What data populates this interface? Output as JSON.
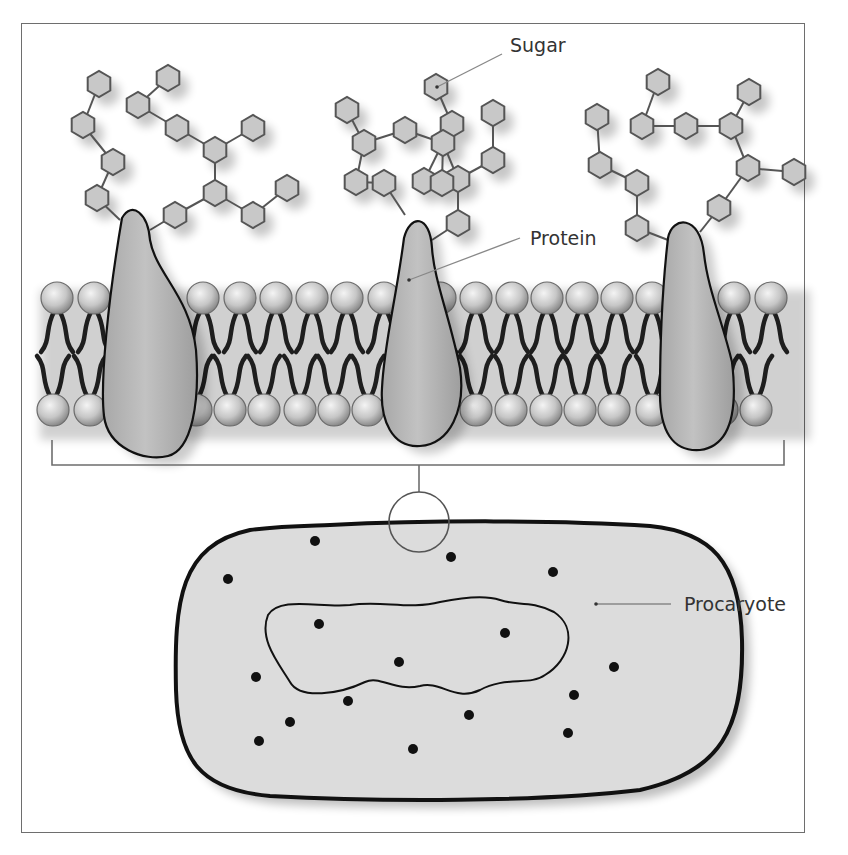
{
  "figure": {
    "labels": {
      "sugar": "Sugar",
      "protein": "Protein",
      "procaryote": "Procaryote"
    },
    "colors": {
      "frame": "#6e6e6e",
      "hexagon_fill": "#c8c8c8",
      "hexagon_stroke": "#555555",
      "protein_fill": "#b4b4b4",
      "head_fill": "#cfcfcf",
      "tail": "#1e1e1e",
      "cell_fill": "#dcdcdc",
      "cell_stroke": "#111111",
      "dot": "#111111",
      "leader": "#888888"
    },
    "membrane": {
      "top_row_y": 298,
      "bottom_row_y": 410,
      "head_radius": 16,
      "top_heads_x": [
        57,
        94,
        131,
        203,
        240,
        276,
        312,
        347,
        384,
        440,
        476,
        512,
        547,
        582,
        617,
        652,
        734,
        771
      ],
      "bottom_heads_x": [
        53,
        90,
        196,
        230,
        264,
        300,
        334,
        368,
        476,
        511,
        546,
        580,
        614,
        652,
        722,
        756
      ]
    },
    "proteins": [
      {
        "id": "protein-left",
        "path": "M122,218 C132,200 148,214 150,240 C156,274 190,296 196,350 C200,402 192,450 168,456 C144,462 108,448 104,416 C100,382 108,300 122,218 Z"
      },
      {
        "id": "protein-middle",
        "path": "M404,238 C410,214 430,214 432,248 C434,280 450,318 460,368 C466,410 450,444 420,446 C392,448 380,420 382,388 C384,344 396,300 404,238 Z"
      },
      {
        "id": "protein-right",
        "path": "M668,238 C672,216 700,214 704,254 C708,290 722,320 732,362 C738,412 730,446 700,450 C672,452 660,430 660,394 C660,340 662,290 668,238 Z"
      }
    ],
    "sugar_chains": {
      "hexagons": [
        [
          99,
          84
        ],
        [
          83,
          125
        ],
        [
          113,
          162
        ],
        [
          97,
          198
        ],
        [
          168,
          78
        ],
        [
          138,
          105
        ],
        [
          177,
          128
        ],
        [
          215,
          150
        ],
        [
          253,
          128
        ],
        [
          215,
          193
        ],
        [
          175,
          215
        ],
        [
          253,
          215
        ],
        [
          287,
          188
        ],
        [
          436,
          87
        ],
        [
          452,
          124
        ],
        [
          493,
          113
        ],
        [
          493,
          160
        ],
        [
          458,
          179
        ],
        [
          458,
          223
        ],
        [
          424,
          181
        ],
        [
          347,
          110
        ],
        [
          364,
          143
        ],
        [
          405,
          130
        ],
        [
          443,
          143
        ],
        [
          442,
          183
        ],
        [
          384,
          183
        ],
        [
          356,
          182
        ],
        [
          658,
          82
        ],
        [
          642,
          126
        ],
        [
          686,
          126
        ],
        [
          731,
          126
        ],
        [
          749,
          92
        ],
        [
          748,
          168
        ],
        [
          794,
          172
        ],
        [
          719,
          208
        ],
        [
          597,
          117
        ],
        [
          600,
          165
        ],
        [
          637,
          183
        ],
        [
          637,
          228
        ]
      ],
      "bonds": [
        [
          [
            99,
            84
          ],
          [
            83,
            125
          ]
        ],
        [
          [
            83,
            125
          ],
          [
            113,
            162
          ]
        ],
        [
          [
            113,
            162
          ],
          [
            97,
            198
          ]
        ],
        [
          [
            97,
            198
          ],
          [
            120,
            220
          ]
        ],
        [
          [
            168,
            78
          ],
          [
            138,
            105
          ]
        ],
        [
          [
            138,
            105
          ],
          [
            177,
            128
          ]
        ],
        [
          [
            177,
            128
          ],
          [
            215,
            150
          ]
        ],
        [
          [
            215,
            150
          ],
          [
            253,
            128
          ]
        ],
        [
          [
            215,
            150
          ],
          [
            215,
            193
          ]
        ],
        [
          [
            215,
            193
          ],
          [
            175,
            215
          ]
        ],
        [
          [
            215,
            193
          ],
          [
            253,
            215
          ]
        ],
        [
          [
            253,
            215
          ],
          [
            287,
            188
          ]
        ],
        [
          [
            175,
            215
          ],
          [
            150,
            230
          ]
        ],
        [
          [
            436,
            87
          ],
          [
            452,
            124
          ]
        ],
        [
          [
            452,
            124
          ],
          [
            424,
            181
          ]
        ],
        [
          [
            347,
            110
          ],
          [
            364,
            143
          ]
        ],
        [
          [
            364,
            143
          ],
          [
            405,
            130
          ]
        ],
        [
          [
            405,
            130
          ],
          [
            443,
            143
          ]
        ],
        [
          [
            443,
            143
          ],
          [
            442,
            183
          ]
        ],
        [
          [
            443,
            143
          ],
          [
            458,
            179
          ]
        ],
        [
          [
            493,
            113
          ],
          [
            493,
            160
          ]
        ],
        [
          [
            493,
            160
          ],
          [
            458,
            179
          ]
        ],
        [
          [
            458,
            179
          ],
          [
            458,
            223
          ]
        ],
        [
          [
            458,
            223
          ],
          [
            432,
            240
          ]
        ],
        [
          [
            364,
            143
          ],
          [
            356,
            182
          ]
        ],
        [
          [
            356,
            182
          ],
          [
            384,
            183
          ]
        ],
        [
          [
            384,
            183
          ],
          [
            405,
            215
          ]
        ],
        [
          [
            658,
            82
          ],
          [
            642,
            126
          ]
        ],
        [
          [
            642,
            126
          ],
          [
            686,
            126
          ]
        ],
        [
          [
            686,
            126
          ],
          [
            731,
            126
          ]
        ],
        [
          [
            731,
            126
          ],
          [
            749,
            92
          ]
        ],
        [
          [
            731,
            126
          ],
          [
            748,
            168
          ]
        ],
        [
          [
            748,
            168
          ],
          [
            794,
            172
          ]
        ],
        [
          [
            748,
            168
          ],
          [
            719,
            208
          ]
        ],
        [
          [
            719,
            208
          ],
          [
            700,
            232
          ]
        ],
        [
          [
            597,
            117
          ],
          [
            600,
            165
          ]
        ],
        [
          [
            600,
            165
          ],
          [
            637,
            183
          ]
        ],
        [
          [
            637,
            183
          ],
          [
            637,
            228
          ]
        ],
        [
          [
            637,
            228
          ],
          [
            668,
            240
          ]
        ]
      ]
    },
    "bracket": {
      "left_x": 52,
      "right_x": 784,
      "y": 465,
      "top_y": 440,
      "stem_x": 419,
      "stem_bottom": 492
    },
    "zoom_circle": {
      "cx": 419,
      "cy": 522,
      "r": 30
    },
    "cell": {
      "outline_path": "M330,525 C430,520 560,520 650,526 C710,532 740,560 742,640 C744,730 720,772 640,790 C540,802 380,802 270,796 C200,790 178,760 176,690 C174,600 180,545 250,530 C280,526 300,526 330,525 Z",
      "nucleoid_path": "M268,615 C280,596 320,608 350,605 C380,600 410,610 440,602 C470,596 488,596 500,600 C516,606 530,600 554,612 C578,628 570,660 545,675 C530,686 505,676 480,690 C455,702 440,680 420,686 C395,692 380,675 365,682 C340,694 300,700 290,682 C280,665 258,640 268,615 Z",
      "dots": [
        [
          315,
          541
        ],
        [
          228,
          579
        ],
        [
          451,
          557
        ],
        [
          553,
          572
        ],
        [
          319,
          624
        ],
        [
          505,
          633
        ],
        [
          399,
          662
        ],
        [
          614,
          667
        ],
        [
          256,
          677
        ],
        [
          574,
          695
        ],
        [
          348,
          701
        ],
        [
          290,
          722
        ],
        [
          469,
          715
        ],
        [
          259,
          741
        ],
        [
          568,
          733
        ],
        [
          413,
          749
        ]
      ]
    },
    "leaders": {
      "sugar": {
        "from": [
          437,
          87
        ],
        "to": [
          502,
          54
        ],
        "text_x": 510,
        "text_y": 52
      },
      "protein": {
        "from": [
          409,
          280
        ],
        "to": [
          520,
          238
        ],
        "text_x": 530,
        "text_y": 245
      },
      "procaryote": {
        "from": [
          596,
          604
        ],
        "to": [
          671,
          604
        ],
        "text_x": 684,
        "text_y": 611
      }
    }
  }
}
